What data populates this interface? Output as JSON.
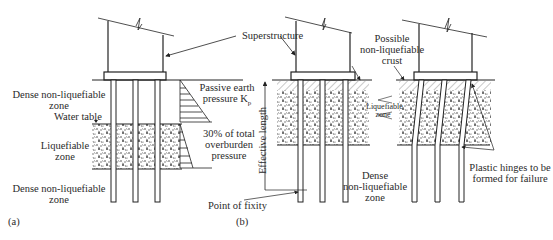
{
  "figure": {
    "panel_a": {
      "caption": "(a)",
      "labels": {
        "superstructure": "Superstructure",
        "dense_top_1": "Dense non-liquefiable",
        "dense_top_2": "zone",
        "water_table": "Water table",
        "liq_1": "Liquefiable",
        "liq_2": "zone",
        "dense_bot_1": "Dense non-liquefiable",
        "dense_bot_2": "zone",
        "passive_1": "Passive earth",
        "passive_2": "pressure K",
        "passive_sub": "p",
        "overburden_1": "30% of total",
        "overburden_2": "overburden",
        "overburden_3": "pressure"
      }
    },
    "panel_b": {
      "caption": "(b)",
      "labels": {
        "crust_1": "Possible",
        "crust_2": "non-liquefiable",
        "crust_3": "crust",
        "effective_length": "Effective length",
        "liq_1": "Liquefiable",
        "liq_2": "zone",
        "dense_1": "Dense",
        "dense_2": "non-liquefiable",
        "dense_3": "zone",
        "fixity": "Point of fixity",
        "hinges_1": "Plastic hinges to be",
        "hinges_2": "formed for failure"
      }
    },
    "colors": {
      "line": "#222222",
      "soil": "#555555",
      "background": "#ffffff"
    }
  }
}
